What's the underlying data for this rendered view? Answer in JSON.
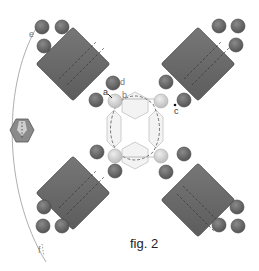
{
  "figure": {
    "caption": "fig. 2",
    "labels": {
      "a": "a",
      "b": "b",
      "c": "c",
      "d": "d",
      "e": "e",
      "f": "f"
    },
    "components": {
      "square_beads": 4,
      "round_beads_per_square": 5,
      "center_bicones": 4,
      "center_pearls": 4,
      "side_bicone": 1
    },
    "colors": {
      "square_fill": "#6a6a6a",
      "square_stroke": "#444444",
      "round_bead_fill": "#707070",
      "pearl_fill": "#d0d0d0",
      "crystal_fill": "#f2f2f2",
      "crystal_stroke": "#bbbbbb",
      "side_bicone_fill": "#8a8a8a",
      "thread": "#888888"
    }
  }
}
